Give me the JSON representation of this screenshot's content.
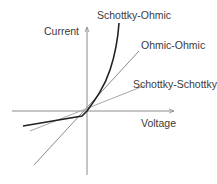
{
  "diagram": {
    "axes": {
      "y_label": "Current",
      "x_label": "Voltage"
    },
    "curves": [
      {
        "id": "schottky-ohmic",
        "label": "Schottky-Ohmic",
        "color": "#222222",
        "shape": "exponential forward, small reverse slope"
      },
      {
        "id": "ohmic-ohmic",
        "label": "Ohmic-Ohmic",
        "color": "#8a8a8a",
        "shape": "linear through origin"
      },
      {
        "id": "schottky-schottky",
        "label": "Schottky-Schottky",
        "color": "#a8a8a8",
        "shape": "low symmetric slope"
      }
    ],
    "axis_color": "#8c8c8c"
  }
}
